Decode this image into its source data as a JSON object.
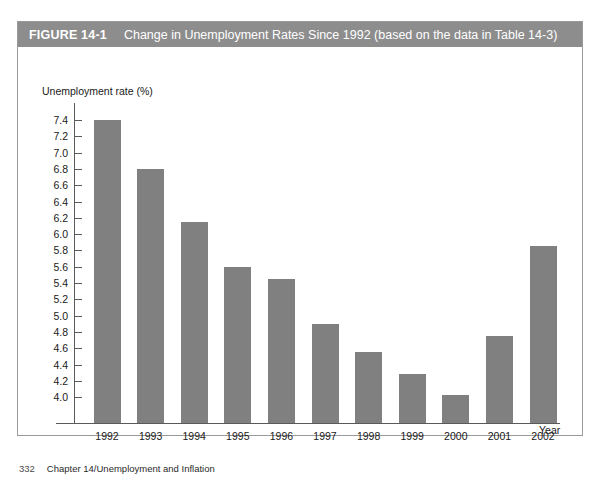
{
  "figure": {
    "number": "FIGURE 14-1",
    "caption": "Change in Unemployment Rates Since 1992 (based on the data in Table 14-3)",
    "header_bg": "#8d8d8d",
    "bar_color": "#808080"
  },
  "footer": {
    "page_number": "332",
    "running_head": "Chapter 14/Unemployment and Inflation"
  },
  "chart_data": {
    "type": "bar",
    "title": "Change in Unemployment Rates Since 1992 (based on the data in Table 14-3)",
    "xlabel": "Year",
    "ylabel": "Unemployment rate (%)",
    "categories": [
      "1992",
      "1993",
      "1994",
      "1995",
      "1996",
      "1997",
      "1998",
      "1999",
      "2000",
      "2001",
      "2002"
    ],
    "values": [
      7.4,
      6.8,
      6.15,
      5.6,
      5.45,
      4.9,
      4.55,
      4.28,
      4.03,
      4.75,
      5.85
    ],
    "ylim": [
      3.9,
      7.5
    ],
    "ytick_values": [
      7.4,
      7.2,
      7.0,
      6.8,
      6.6,
      6.4,
      6.2,
      6.0,
      5.8,
      5.6,
      5.4,
      5.2,
      5.0,
      4.8,
      4.6,
      4.4,
      4.2,
      4.0
    ],
    "ytick_labels": [
      "7.4",
      "7.2",
      "7.0",
      "6.8",
      "6.6",
      "6.4",
      "6.2",
      "6.0",
      "5.8",
      "5.6",
      "5.4",
      "5.2",
      "5.0",
      "4.8",
      "4.6",
      "4.4",
      "4.2",
      "4.0"
    ],
    "grid": false,
    "legend": false
  }
}
